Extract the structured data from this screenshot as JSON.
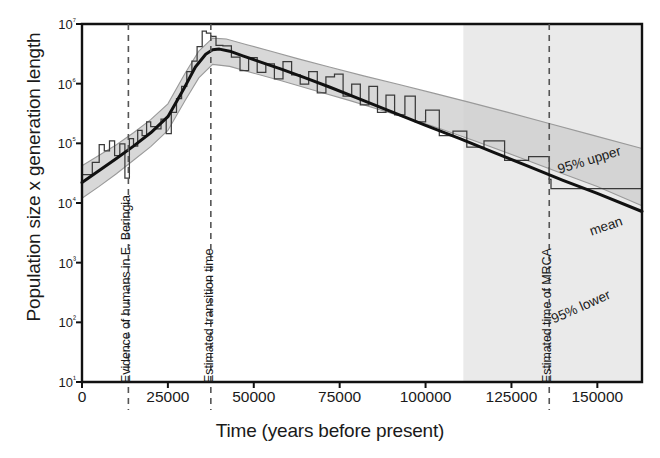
{
  "figure": {
    "axis_color": "#111111",
    "band_fill": "#d0d0d0",
    "band_edge": "#9a9a9a",
    "shade_fill": "#eaeaea",
    "mean_color": "#111111",
    "skyline_color": "#3a3a3a",
    "dash_color": "#555555"
  },
  "chart_data": {
    "type": "line",
    "title": "",
    "xlabel": "Time (years before present)",
    "ylabel": "Population size x generation length",
    "xlim": [
      0,
      163000
    ],
    "ylim": [
      10,
      10000000
    ],
    "yscale": "log",
    "grid": false,
    "legend_position": "inline-right",
    "xticks": [
      0,
      25000,
      50000,
      75000,
      100000,
      125000,
      150000
    ],
    "xtick_labels": [
      "0",
      "25000",
      "50000",
      "75000",
      "100000",
      "125000",
      "150000"
    ],
    "yticks": [
      10,
      100,
      1000,
      10000,
      100000,
      1000000,
      10000000
    ],
    "ytick_labels": [
      "10¹",
      "10²",
      "10³",
      "10⁴",
      "10⁵",
      "10⁶",
      "10⁷"
    ],
    "annotations": [
      {
        "name": "evidence-of-humans",
        "label": "Evidence of humans in E. Beringia",
        "x": 13500,
        "style": "dashed-vertical"
      },
      {
        "name": "estimated-transition-time",
        "label": "Estimated transition time",
        "x": 37500,
        "style": "dashed-vertical"
      },
      {
        "name": "estimated-time-of-mrca",
        "label": "Estimated time of MRCA",
        "x": 136000,
        "style": "dashed-vertical"
      }
    ],
    "shaded_region": {
      "name": "low-information-region",
      "x_start": 111000,
      "x_end": 163000
    },
    "series": [
      {
        "name": "mean",
        "label": "mean",
        "style": "solid-thick",
        "x": [
          0,
          5000,
          10000,
          15000,
          20000,
          25000,
          30000,
          33000,
          36000,
          38000,
          40000,
          43000,
          47000,
          52000,
          58000,
          65000,
          72000,
          80000,
          90000,
          100000,
          110000,
          120000,
          130000,
          140000,
          150000,
          163000
        ],
        "y": [
          22000,
          35000,
          56000,
          90000,
          150000,
          280000,
          900000,
          1900000,
          3100000,
          3700000,
          3800000,
          3500000,
          2900000,
          2300000,
          1750000,
          1250000,
          880000,
          580000,
          340000,
          200000,
          120000,
          70000,
          41000,
          24000,
          14500,
          7200
        ]
      },
      {
        "name": "ci-95-upper",
        "label": "95% upper",
        "style": "band-edge",
        "x": [
          0,
          5000,
          10000,
          15000,
          20000,
          25000,
          30000,
          34000,
          38000,
          42000,
          48000,
          55000,
          63000,
          72000,
          82000,
          92000,
          102000,
          112000,
          124000,
          136000,
          148000,
          163000
        ],
        "y": [
          42000,
          63000,
          95000,
          150000,
          250000,
          460000,
          1500000,
          3500000,
          5800000,
          5600000,
          4500000,
          3500000,
          2600000,
          1900000,
          1350000,
          980000,
          700000,
          500000,
          330000,
          215000,
          140000,
          82000
        ]
      },
      {
        "name": "ci-95-lower",
        "label": "95% lower",
        "style": "band-edge",
        "x": [
          0,
          5000,
          10000,
          15000,
          20000,
          25000,
          30000,
          34000,
          38000,
          43000,
          50000,
          58000,
          68000,
          78000,
          90000,
          102000,
          114000,
          126000,
          138000,
          150000,
          163000
        ],
        "y": [
          12000,
          19000,
          31000,
          52000,
          88000,
          165000,
          520000,
          1250000,
          2100000,
          1950000,
          1500000,
          1120000,
          760000,
          520000,
          320000,
          195000,
          112000,
          62000,
          34000,
          19000,
          9000
        ]
      },
      {
        "name": "skyline-plot",
        "label": "skyline",
        "style": "step",
        "x": [
          0,
          3000,
          5000,
          6500,
          8000,
          9500,
          11000,
          12500,
          13800,
          15000,
          16200,
          17500,
          18800,
          20000,
          21500,
          23000,
          24500,
          26000,
          27500,
          29000,
          30500,
          32000,
          33500,
          35000,
          36200,
          37500,
          39000,
          41000,
          43500,
          46000,
          48500,
          51000,
          53500,
          56000,
          58500,
          61000,
          63500,
          66000,
          68500,
          71000,
          73500,
          76000,
          78500,
          81000,
          83500,
          86000,
          88500,
          91000,
          94000,
          97000,
          100000,
          104000,
          108000,
          112000,
          117000,
          123000,
          130000,
          136000,
          136500,
          163000
        ],
        "y": [
          30000,
          48000,
          95000,
          75000,
          110000,
          62000,
          98000,
          26000,
          120000,
          90000,
          165000,
          135000,
          230000,
          190000,
          175000,
          255000,
          145000,
          330000,
          560000,
          900000,
          1600000,
          2400000,
          4200000,
          7600000,
          7000000,
          6200000,
          4400000,
          4300000,
          2800000,
          1650000,
          2750000,
          1550000,
          2150000,
          1200000,
          2350000,
          1400000,
          980000,
          1600000,
          700000,
          1300000,
          1450000,
          620000,
          980000,
          440000,
          900000,
          330000,
          640000,
          300000,
          620000,
          230000,
          360000,
          135000,
          160000,
          86000,
          110000,
          52000,
          60000,
          25000,
          17500,
          9000
        ]
      }
    ]
  }
}
